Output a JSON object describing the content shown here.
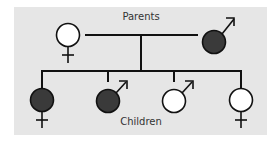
{
  "diagram": {
    "type": "pedigree",
    "labels": {
      "parents": "Parents",
      "children": "Children"
    },
    "colors": {
      "background": "#e6e6e6",
      "affected_fill": "#3a3a3a",
      "unaffected_fill": "#ffffff",
      "line": "#111111"
    },
    "parents": [
      {
        "id": "mother",
        "sex": "female",
        "affected": false
      },
      {
        "id": "father",
        "sex": "male",
        "affected": true
      }
    ],
    "children": [
      {
        "id": "child-1",
        "sex": "female",
        "affected": true
      },
      {
        "id": "child-2",
        "sex": "male",
        "affected": true
      },
      {
        "id": "child-3",
        "sex": "male",
        "affected": false
      },
      {
        "id": "child-4",
        "sex": "female",
        "affected": false
      }
    ]
  }
}
